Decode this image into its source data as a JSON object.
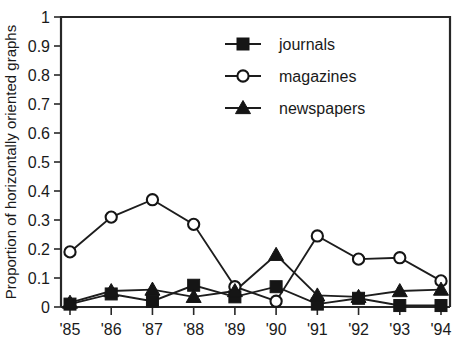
{
  "chart_data": {
    "type": "line",
    "title": "",
    "subtitle": "",
    "xlabel": "",
    "ylabel": "Proportion of horizontally oriented graphs",
    "categories": [
      "'85",
      "'86",
      "'87",
      "'88",
      "'89",
      "'90",
      "'91",
      "'92",
      "'93",
      "'94"
    ],
    "xlim": [
      0,
      9
    ],
    "ylim": [
      0,
      1
    ],
    "yticks": [
      "0",
      "0.1",
      "0.2",
      "0.3",
      "0.4",
      "0.5",
      "0.6",
      "0.7",
      "0.8",
      "0.9",
      "1"
    ],
    "ytick_values": [
      0,
      0.1,
      0.2,
      0.3,
      0.4,
      0.5,
      0.6,
      0.7,
      0.8,
      0.9,
      1
    ],
    "grid": false,
    "legend_position": "upper-right-inside",
    "series": [
      {
        "name": "journals",
        "marker": "filled-square",
        "color": "#151515",
        "values": [
          0.01,
          0.045,
          0.02,
          0.075,
          0.035,
          0.07,
          0.01,
          0.03,
          0.005,
          0.005
        ]
      },
      {
        "name": "magazines",
        "marker": "open-circle",
        "color": "#151515",
        "values": [
          0.19,
          0.31,
          0.37,
          0.285,
          0.07,
          0.02,
          0.245,
          0.165,
          0.17,
          0.09
        ]
      },
      {
        "name": "newspapers",
        "marker": "filled-triangle",
        "color": "#151515",
        "values": [
          0.015,
          0.055,
          0.06,
          0.035,
          0.055,
          0.18,
          0.04,
          0.035,
          0.055,
          0.06
        ]
      }
    ],
    "annotations": []
  },
  "legend": {
    "items": [
      {
        "label": "journals",
        "marker": "filled-square"
      },
      {
        "label": "magazines",
        "marker": "open-circle"
      },
      {
        "label": "newspapers",
        "marker": "filled-triangle"
      }
    ]
  },
  "colors": {
    "axis": "#272727",
    "ink": "#1a1a1a",
    "background": "#ffffff",
    "series": "#151515"
  }
}
